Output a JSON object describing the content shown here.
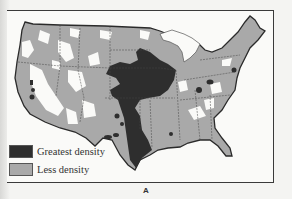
{
  "figure": {
    "caption": "A"
  },
  "legend": {
    "items": [
      {
        "label": "Greatest density",
        "color": "#2e2e2e"
      },
      {
        "label": "Less density",
        "color": "#a9a9a9"
      }
    ]
  },
  "colors": {
    "greatest": "#2e2e2e",
    "less": "#a9a9a9",
    "none": "#fafaf8",
    "border": "#2a2a2a"
  }
}
